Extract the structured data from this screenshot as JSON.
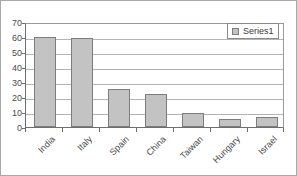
{
  "chart_data": {
    "type": "bar",
    "title": "",
    "xlabel": "",
    "ylabel": "",
    "categories": [
      "India",
      "Italy",
      "Spain",
      "China",
      "Taiwan",
      "Hungary",
      "Israel"
    ],
    "values": [
      60,
      59.5,
      25,
      22,
      9.5,
      5,
      6.5
    ],
    "series": [
      {
        "name": "Series1",
        "values": [
          60,
          59.5,
          25,
          22,
          9.5,
          5,
          6.5
        ]
      }
    ],
    "ylim": [
      0,
      70
    ],
    "yticks": [
      0,
      10,
      20,
      30,
      40,
      50,
      60,
      70
    ],
    "ytick_labels": [
      "0",
      "10",
      "20",
      "30",
      "40",
      "50",
      "60",
      "70"
    ],
    "grid": true,
    "grid_axis": "y",
    "legend": {
      "position": "top-right",
      "entries": [
        {
          "label": "Series1",
          "swatch_name": "series1-color-swatch"
        }
      ]
    },
    "colors": {
      "bar_fill": "#c3c3c3",
      "bar_border": "#7d7d7d",
      "gridline": "#b4b4b4",
      "axis": "#6e6e6e",
      "text": "#4a4a4a",
      "background": "#ffffff",
      "frame_border": "#a8a8a8"
    },
    "xtick_label_rotation": -45
  }
}
